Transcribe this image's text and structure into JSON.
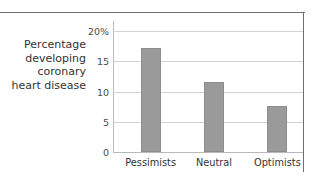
{
  "chart_data": {
    "type": "bar",
    "title": "",
    "subtitle": "",
    "xlabel": "",
    "ylabel": "Percentage\ndeveloping\ncoronary\nheart disease",
    "categories": [
      "Pessimists",
      "Neutral",
      "Optimists"
    ],
    "values": [
      17.2,
      11.6,
      7.7
    ],
    "series": [
      {
        "name": "Percentage developing coronary heart disease",
        "values": [
          17.2,
          11.6,
          7.7
        ]
      }
    ],
    "ylim": [
      0,
      21.7
    ],
    "yticks": [
      0,
      5,
      10,
      15,
      20
    ],
    "ytick_labels": [
      "0",
      "5",
      "10",
      "15",
      "20%"
    ],
    "grid": true,
    "grid_axis": "y",
    "legend": false,
    "legend_position": "none",
    "bar_color": "#9a9a9a",
    "gridline_color": "#d2d2d2",
    "axis_color": "#b9b9b9",
    "frame_color": "#6f6f6f",
    "text_color": "#333333"
  },
  "figure": {
    "axis_title": "Percentage\ndeveloping\ncoronary\nheart disease"
  }
}
